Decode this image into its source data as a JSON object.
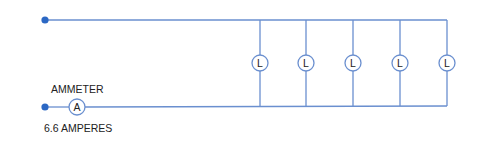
{
  "diagram": {
    "colors": {
      "wire": "#6a8fcf",
      "node": "#2c68c4",
      "component_stroke": "#6a8fcf",
      "text": "#222222"
    },
    "ammeter": {
      "label": "AMMETER",
      "symbol": "A",
      "reading": "6.6 AMPERES"
    },
    "lamps": [
      {
        "symbol": "L"
      },
      {
        "symbol": "L"
      },
      {
        "symbol": "L"
      },
      {
        "symbol": "L"
      },
      {
        "symbol": "L"
      }
    ],
    "lamp_count": 5
  }
}
